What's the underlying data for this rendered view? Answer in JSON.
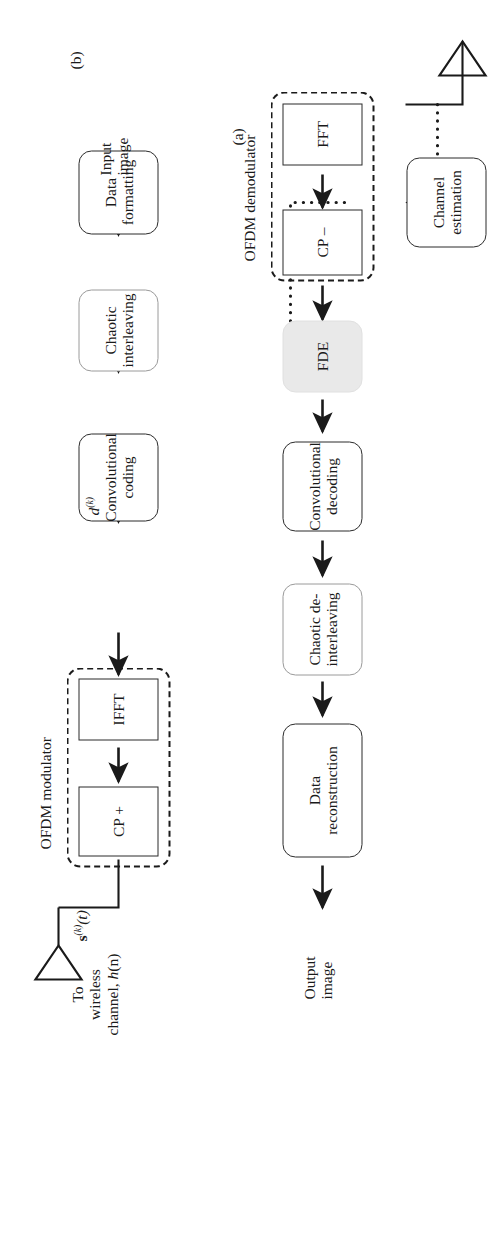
{
  "figure": {
    "type": "block-diagram",
    "orientation": "rotated-90-ccw",
    "panels": [
      {
        "id": "a",
        "label": "(a)",
        "title": "Transmitter"
      },
      {
        "id": "b",
        "label": "(b)",
        "title": "Receiver"
      }
    ]
  },
  "colors": {
    "line": "#2b2b2b",
    "text": "#1a1a1a",
    "shaded_fill": "#e9e9e9",
    "light_border": "#9a9a9a",
    "background": "#ffffff"
  },
  "transmitter": {
    "panel_label": "(a)",
    "input_label_line1": "Input",
    "input_label_line2": "image",
    "blocks": [
      {
        "id": "data-formatting",
        "line1": "Data",
        "line2": "formatting",
        "style": "rounded"
      },
      {
        "id": "chaotic-interleaving",
        "line1": "Chaotic",
        "line2": "interleaving",
        "style": "rounded-light"
      },
      {
        "id": "convolutional-coding",
        "line1": "Convolutional",
        "line2": "coding",
        "style": "rounded"
      },
      {
        "id": "ifft",
        "line1": "IFFT",
        "line2": "",
        "style": "sharp"
      },
      {
        "id": "cp-add",
        "line1": "CP +",
        "line2": "",
        "style": "sharp"
      }
    ],
    "group_label": "OFDM modulator",
    "signal_d": "d",
    "signal_d_sup": "(k)",
    "signal_s_bold": "s",
    "signal_s_sup": "(k)",
    "signal_s_arg": "(t)",
    "channel_note_line1": "To",
    "channel_note_line2": "wireless",
    "channel_note_line3": "channel,",
    "channel_note_h": "h",
    "channel_note_n": "(n)"
  },
  "receiver": {
    "panel_label": "(b)",
    "output_label_line1": "Output",
    "output_label_line2": "image",
    "blocks": [
      {
        "id": "fft",
        "line1": "FFT",
        "line2": "",
        "style": "sharp"
      },
      {
        "id": "cp-remove",
        "line1": "CP –",
        "line2": "",
        "style": "sharp"
      },
      {
        "id": "fde",
        "line1": "FDE",
        "line2": "",
        "style": "shaded"
      },
      {
        "id": "convolutional-decoding",
        "line1": "Convolutional",
        "line2": "decoding",
        "style": "rounded"
      },
      {
        "id": "chaotic-deinterleaving",
        "line1": "Chaotic de-",
        "line2": "interleaving",
        "style": "rounded-light"
      },
      {
        "id": "data-reconstruction",
        "line1": "Data",
        "line2": "reconstruction",
        "style": "rounded"
      },
      {
        "id": "channel-estimation",
        "line1": "Channel",
        "line2": "estimation",
        "style": "rounded"
      }
    ],
    "group_label": "OFDM demodulator"
  },
  "icons": {
    "tx_antenna": "antenna-icon",
    "rx_antenna": "antenna-icon",
    "solid_arrow": "arrow-icon",
    "dotted_arrow": "dotted-arrow-icon"
  }
}
